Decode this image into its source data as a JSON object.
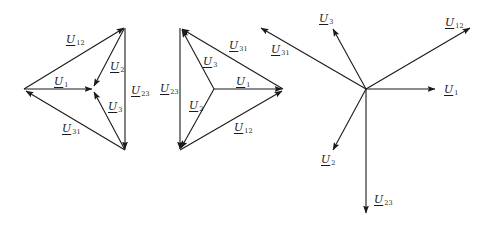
{
  "figure": {
    "stroke_color": "#1a1a1a",
    "background": "#ffffff",
    "diagrams": [
      {
        "id": "delta-inward",
        "description": "Line voltage triangle with phase voltages pointing to centroid",
        "labels": {
          "U12": {
            "main": "U",
            "sub": "12"
          },
          "U2": {
            "main": "U",
            "sub": "2"
          },
          "U1": {
            "main": "U",
            "sub": "1"
          },
          "U23": {
            "main": "U",
            "sub": "23"
          },
          "U3": {
            "main": "U",
            "sub": "3"
          },
          "U31": {
            "main": "U",
            "sub": "31"
          }
        }
      },
      {
        "id": "delta-outward",
        "description": "Line voltage triangle with phase voltages pointing from centroid to vertices",
        "labels": {
          "U31": {
            "main": "U",
            "sub": "31"
          },
          "U3": {
            "main": "U",
            "sub": "3"
          },
          "U1": {
            "main": "U",
            "sub": "1"
          },
          "U23": {
            "main": "U",
            "sub": "23"
          },
          "U2": {
            "main": "U",
            "sub": "2"
          },
          "U12": {
            "main": "U",
            "sub": "12"
          }
        }
      },
      {
        "id": "star-phasors",
        "description": "All phase and line voltage phasors drawn from a common origin",
        "labels": {
          "U3": {
            "main": "U",
            "sub": "3"
          },
          "U12": {
            "main": "U",
            "sub": "12"
          },
          "U31": {
            "main": "U",
            "sub": "31"
          },
          "U1": {
            "main": "U",
            "sub": "1"
          },
          "U2": {
            "main": "U",
            "sub": "2"
          },
          "U23": {
            "main": "U",
            "sub": "23"
          }
        }
      }
    ]
  }
}
